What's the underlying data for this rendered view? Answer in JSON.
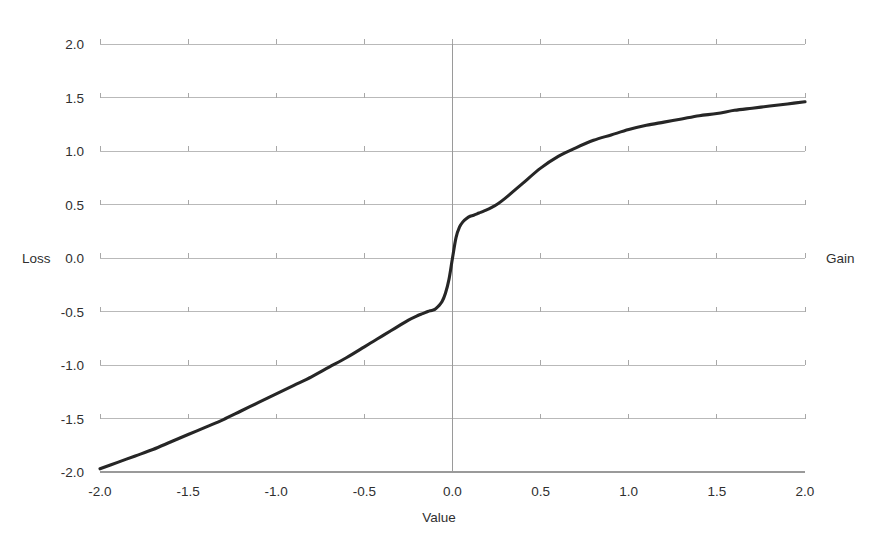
{
  "chart_data": {
    "type": "line",
    "title": "",
    "subtitle": "",
    "xlabel": "Value",
    "ylabel": "",
    "xlim": [
      -2.0,
      2.0
    ],
    "ylim": [
      -2.0,
      2.0
    ],
    "grid": true,
    "legend": "none",
    "x_ticks": [
      "-2.0",
      "-1.5",
      "-1.0",
      "-0.5",
      "0.0",
      "0.5",
      "1.0",
      "1.5",
      "2.0"
    ],
    "x_tick_values": [
      -2.0,
      -1.5,
      -1.0,
      -0.5,
      0.0,
      0.5,
      1.0,
      1.5,
      2.0
    ],
    "y_ticks": [
      "2.0",
      "1.5",
      "1.0",
      "0.5",
      "0.0",
      "-0.5",
      "-1.0",
      "-1.5",
      "-2.0"
    ],
    "y_tick_values": [
      2.0,
      1.5,
      1.0,
      0.5,
      0.0,
      -0.5,
      -1.0,
      -1.5,
      -2.0
    ],
    "annotations": [
      {
        "text": "Loss",
        "side": "left",
        "at_y": 0.0
      },
      {
        "text": "Gain",
        "side": "right",
        "at_y": 0.0
      }
    ],
    "series": [
      {
        "name": "value function",
        "color": "#262626",
        "x": [
          -2.0,
          -1.9,
          -1.8,
          -1.7,
          -1.6,
          -1.5,
          -1.4,
          -1.3,
          -1.2,
          -1.1,
          -1.0,
          -0.9,
          -0.8,
          -0.7,
          -0.6,
          -0.5,
          -0.45,
          -0.4,
          -0.35,
          -0.3,
          -0.25,
          -0.2,
          -0.17,
          -0.14,
          -0.12,
          -0.1,
          -0.08,
          -0.06,
          -0.04,
          -0.02,
          0.0,
          0.02,
          0.04,
          0.06,
          0.08,
          0.1,
          0.12,
          0.15,
          0.18,
          0.22,
          0.26,
          0.3,
          0.35,
          0.4,
          0.5,
          0.6,
          0.7,
          0.8,
          0.9,
          1.0,
          1.1,
          1.2,
          1.3,
          1.4,
          1.5,
          1.6,
          1.7,
          1.8,
          1.9,
          2.0
        ],
        "y": [
          -1.97,
          -1.91,
          -1.85,
          -1.79,
          -1.72,
          -1.65,
          -1.58,
          -1.51,
          -1.43,
          -1.35,
          -1.27,
          -1.19,
          -1.11,
          -1.02,
          -0.93,
          -0.83,
          -0.78,
          -0.73,
          -0.68,
          -0.63,
          -0.58,
          -0.54,
          -0.52,
          -0.5,
          -0.49,
          -0.48,
          -0.45,
          -0.41,
          -0.33,
          -0.2,
          0.0,
          0.19,
          0.29,
          0.34,
          0.37,
          0.39,
          0.4,
          0.42,
          0.44,
          0.47,
          0.51,
          0.56,
          0.63,
          0.7,
          0.84,
          0.95,
          1.03,
          1.1,
          1.15,
          1.2,
          1.24,
          1.27,
          1.3,
          1.33,
          1.35,
          1.38,
          1.4,
          1.42,
          1.44,
          1.46
        ]
      }
    ]
  },
  "axes": {
    "x_title": "Value",
    "left_label": "Loss",
    "right_label": "Gain"
  }
}
